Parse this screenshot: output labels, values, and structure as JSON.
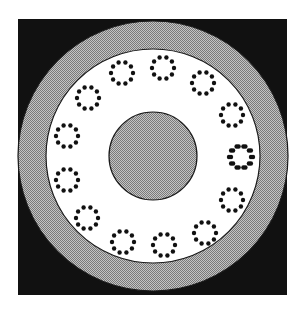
{
  "diagram": {
    "title": "",
    "background": {
      "x": 18,
      "y": 19,
      "width": 269,
      "height": 276,
      "color": "#111111"
    },
    "center": {
      "x": 153,
      "y": 156
    },
    "outer_ring": {
      "radius": 135,
      "color": "#a3a3a3",
      "stroke": "#1a1a1a"
    },
    "annulus": {
      "radius": 107,
      "color": "#ffffff",
      "stroke": "#1a1a1a"
    },
    "core": {
      "radius": 44,
      "color": "#a3a3a3",
      "stroke": "#1a1a1a"
    },
    "clusters": {
      "dot_count": 10,
      "dot_radius": 2.2,
      "ring_radius": 11,
      "color": "#111111",
      "centers": [
        [
          240,
          157
        ],
        [
          232,
          115
        ],
        [
          203,
          83
        ],
        [
          163,
          68
        ],
        [
          122,
          73
        ],
        [
          88,
          98
        ],
        [
          67,
          136
        ],
        [
          67,
          180
        ],
        [
          87,
          218
        ],
        [
          123,
          242
        ],
        [
          164,
          245
        ],
        [
          205,
          233
        ],
        [
          232,
          200
        ],
        [
          242,
          157
        ]
      ]
    }
  }
}
